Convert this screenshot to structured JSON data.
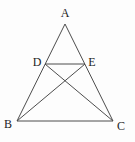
{
  "diagram": {
    "type": "geometry",
    "description_labels": [
      "A",
      "B",
      "C",
      "D",
      "E"
    ],
    "background_color": "#fdfdfd",
    "stroke_color": "#4d4d4d",
    "label_color": "#1c1c1c",
    "stroke_width": 1,
    "points": {
      "A": {
        "x": 65,
        "y": 24,
        "label": "A",
        "label_x": 65,
        "label_y": 17
      },
      "B": {
        "x": 17,
        "y": 121,
        "label": "B",
        "label_x": 8,
        "label_y": 128
      },
      "C": {
        "x": 113,
        "y": 121,
        "label": "C",
        "label_x": 121,
        "label_y": 130
      },
      "D": {
        "x": 45,
        "y": 64,
        "label": "D",
        "label_x": 37,
        "label_y": 66
      },
      "E": {
        "x": 85,
        "y": 64,
        "label": "E",
        "label_x": 92,
        "label_y": 66
      }
    },
    "edges": [
      {
        "from": "A",
        "to": "B"
      },
      {
        "from": "A",
        "to": "C"
      },
      {
        "from": "B",
        "to": "C"
      },
      {
        "from": "D",
        "to": "E"
      },
      {
        "from": "D",
        "to": "C"
      },
      {
        "from": "E",
        "to": "B"
      }
    ]
  }
}
